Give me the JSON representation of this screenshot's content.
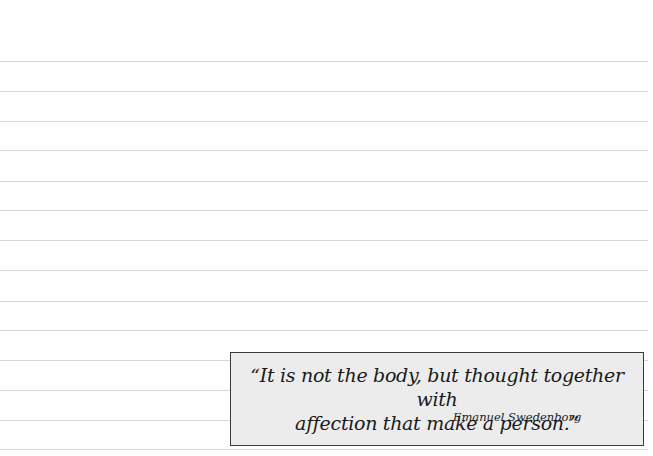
{
  "page": {
    "ruled_lines_y": [
      61,
      91,
      121,
      150,
      181,
      210,
      240,
      270,
      301,
      330,
      360,
      390,
      420,
      449
    ],
    "colors": {
      "background": "#ffffff",
      "rule_line": "#d6d6d6",
      "quote_box_fill": "#ececec",
      "quote_box_border": "#3a3a3a",
      "text": "#1a1a1a"
    }
  },
  "quote": {
    "line1": "“It is not the body, but thought together with",
    "line2": "affection that make a person.”",
    "author": "Emanuel Swedenborg"
  }
}
